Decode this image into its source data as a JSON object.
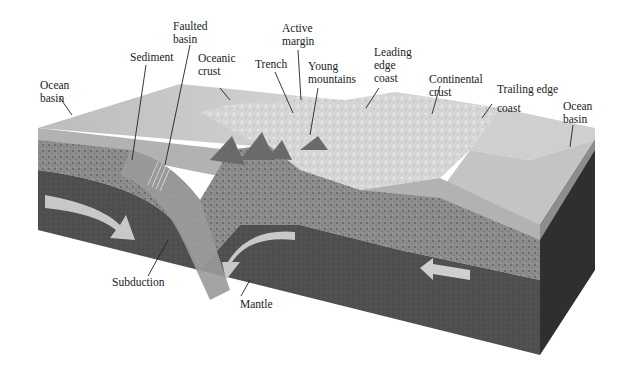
{
  "diagram": {
    "colors": {
      "ocean_top": "#c9c9c9",
      "ocean_side": "#b4b4b4",
      "sediment": "#9a9a9a",
      "crust_speckled": "#8a8a8a",
      "mantle": "#4e4e4e",
      "mantle_dark_side": "#2e2e2e",
      "continent": "#d8d8d8",
      "arrow": "#c8c8c8",
      "label_text": "#1a1a1a",
      "leader_line": "#222222"
    },
    "labels": {
      "ocean_basin_left": "Ocean\nbasin",
      "sediment": "Sediment",
      "faulted_basin": "Faulted\nbasin",
      "oceanic_crust": "Oceanic\ncrust",
      "trench": "Trench",
      "active_margin": "Active\nmargin",
      "young_mountains": "Young\nmountains",
      "leading_edge_coast": "Leading\nedge\ncoast",
      "continental_crust": "Continental\ncrust",
      "trailing_edge_coast": "Trailing edge\ncoast",
      "ocean_basin_right": "Ocean\nbasin",
      "subduction": "Subduction",
      "mantle": "Mantle"
    },
    "arrows": [
      {
        "name": "left-mantle-flow-arrow",
        "direction": "down-right"
      },
      {
        "name": "center-mantle-convection-arrow",
        "direction": "curving-down-left"
      },
      {
        "name": "right-mantle-flow-arrow",
        "direction": "left"
      }
    ]
  }
}
